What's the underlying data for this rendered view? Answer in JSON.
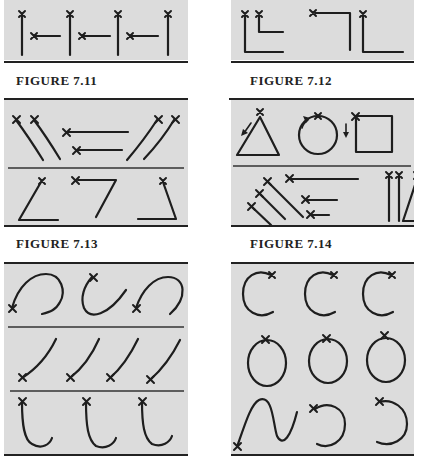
{
  "page": {
    "background": "#ffffff",
    "panel_color": "#dcdcdc",
    "stroke_color": "#1e1e1e"
  },
  "figures": [
    {
      "id": "7.11",
      "caption": "FIGURE 7.11",
      "description": "Alternating vertical strokes drawn upward and horizontal strokes drawn leftward, start points marked with x"
    },
    {
      "id": "7.12",
      "caption": "FIGURE 7.12",
      "description": "L-shaped and inverted L-shaped strokes with start points marked"
    },
    {
      "id": "7.13",
      "caption": "FIGURE 7.13",
      "description": "Curved diagonal strokes, leftward horizontal strokes, and angled corner shapes"
    },
    {
      "id": "7.14",
      "caption": "FIGURE 7.14",
      "description": "Triangle, circle and square with directional arrows; diagonal, horizontal and vertical strokes"
    },
    {
      "id": "7.15",
      "caption": "",
      "description": "Arches, descending curved strokes and hook shapes"
    },
    {
      "id": "7.16",
      "caption": "",
      "description": "C shapes, ovals, S-curve and reversed C shapes"
    }
  ]
}
